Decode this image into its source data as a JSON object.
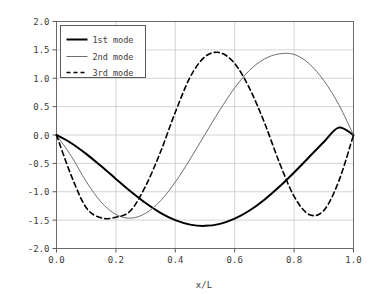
{
  "chart_data": {
    "type": "line",
    "title": "",
    "xlabel": "x/L",
    "ylabel": "",
    "xlim": [
      0.0,
      1.0
    ],
    "ylim": [
      -2.0,
      2.0
    ],
    "grid": true,
    "legend_position": "top-left",
    "xticks": [
      "0.0",
      "0.2",
      "0.4",
      "0.6",
      "0.8",
      "1.0"
    ],
    "xtick_values": [
      0.0,
      0.2,
      0.4,
      0.6,
      0.8,
      1.0
    ],
    "yticks": [
      "2.0",
      "1.5",
      "1.0",
      "0.5",
      "0.0",
      "-0.5",
      "-1.0",
      "-1.5",
      "-2.0"
    ],
    "ytick_values": [
      2.0,
      1.5,
      1.0,
      0.5,
      0.0,
      -0.5,
      -1.0,
      -1.5,
      -2.0
    ],
    "series": [
      {
        "name": "1st mode",
        "color": "#000000",
        "style": "solid",
        "width": 2.0,
        "x": [
          0.0,
          0.05,
          0.1,
          0.15,
          0.2,
          0.25,
          0.3,
          0.35,
          0.4,
          0.45,
          0.5,
          0.55,
          0.6,
          0.65,
          0.7,
          0.75,
          0.8,
          0.85,
          0.9,
          0.95,
          1.0
        ],
        "values": [
          0.0,
          -0.145,
          -0.333,
          -0.548,
          -0.774,
          -0.996,
          -1.199,
          -1.371,
          -1.5,
          -1.579,
          -1.601,
          -1.566,
          -1.474,
          -1.33,
          -1.14,
          -0.913,
          -0.66,
          -0.392,
          -0.123,
          0.13,
          0.0
        ]
      },
      {
        "name": "2nd mode",
        "color": "#6e6e6e",
        "style": "solid",
        "width": 1.0,
        "x": [
          0.0,
          0.05,
          0.1,
          0.15,
          0.2,
          0.25,
          0.3,
          0.35,
          0.4,
          0.45,
          0.5,
          0.55,
          0.6,
          0.65,
          0.7,
          0.75,
          0.8,
          0.85,
          0.9,
          0.95,
          1.0
        ],
        "values": [
          0.0,
          -0.375,
          -0.82,
          -1.18,
          -1.4,
          -1.465,
          -1.38,
          -1.16,
          -0.83,
          -0.425,
          0.01,
          0.44,
          0.83,
          1.14,
          1.34,
          1.43,
          1.42,
          1.26,
          0.96,
          0.54,
          0.0
        ]
      },
      {
        "name": "3rd mode",
        "color": "#000000",
        "style": "dashed",
        "width": 1.6,
        "x": [
          0.0,
          0.05,
          0.1,
          0.15,
          0.2,
          0.25,
          0.3,
          0.35,
          0.4,
          0.45,
          0.5,
          0.55,
          0.6,
          0.65,
          0.7,
          0.75,
          0.8,
          0.85,
          0.9,
          0.95,
          1.0
        ],
        "values": [
          0.0,
          -0.72,
          -1.28,
          -1.46,
          -1.45,
          -1.33,
          -0.9,
          -0.3,
          0.4,
          1.02,
          1.38,
          1.45,
          1.26,
          0.82,
          0.22,
          -0.48,
          -1.08,
          -1.4,
          -1.33,
          -0.82,
          0.0
        ]
      }
    ],
    "annotations": []
  },
  "legend": {
    "entries": [
      {
        "label": "1st mode",
        "sample": "solid-thick-black"
      },
      {
        "label": "2nd mode",
        "sample": "solid-thin-gray"
      },
      {
        "label": "3rd mode",
        "sample": "dashed-black"
      }
    ]
  },
  "colors": {
    "axis": "#5a5a5a",
    "grid": "#c8c8c8",
    "frame": "#6b6b6b",
    "background": "#ffffff",
    "mode1": "#000000",
    "mode2": "#6e6e6e",
    "mode3": "#000000"
  }
}
